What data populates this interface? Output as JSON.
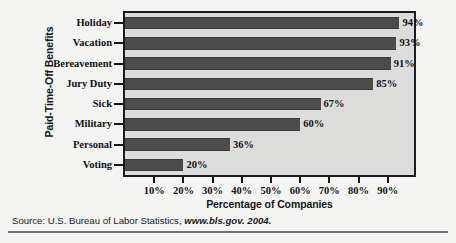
{
  "chart_data": {
    "type": "bar",
    "orientation": "horizontal",
    "title": "",
    "xlabel": "Percentage of Companies",
    "ylabel": "Paid-Time-Off Benefits",
    "categories": [
      "Holiday",
      "Vacation",
      "Bereavement",
      "Jury Duty",
      "Sick",
      "Military",
      "Personal",
      "Voting"
    ],
    "values": [
      94,
      93,
      91,
      85,
      67,
      60,
      36,
      20
    ],
    "data_labels": [
      "94%",
      "93%",
      "91%",
      "85%",
      "67%",
      "60%",
      "36%",
      "20%"
    ],
    "xticks": [
      10,
      20,
      30,
      40,
      50,
      60,
      70,
      80,
      90
    ],
    "xtick_labels": [
      "10%",
      "20%",
      "30%",
      "40%",
      "50%",
      "60%",
      "70%",
      "80%",
      "90%"
    ],
    "xlim": [
      0,
      99
    ],
    "grid": false,
    "legend": false,
    "bar_color": "#4c4c4c",
    "plot_background": "#dcdcda",
    "frame_color": "#1b1c20",
    "figure_background": "#f4f4f2"
  },
  "source": {
    "prefix": "Source: U.S. Bureau of Labor Statistics,",
    "citation": "www.bls.gov. 2004."
  }
}
